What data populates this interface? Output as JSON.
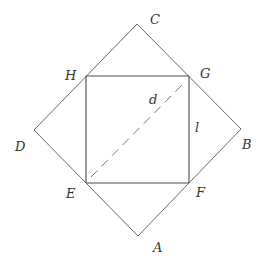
{
  "figure": {
    "width": 262,
    "height": 258,
    "colors": {
      "background": "#ffffff",
      "outer_square": "#6a6a6a",
      "inner_square": "#4a4a4a",
      "diagonal": "#7a7a7a",
      "labels": "#333333"
    },
    "outer_square": {
      "vertices": {
        "A": [
          138,
          236
        ],
        "B": [
          241,
          129
        ],
        "C": [
          137,
          24
        ],
        "D": [
          34,
          130
        ]
      }
    },
    "inner_square": {
      "vertices": {
        "E": [
          86,
          183
        ],
        "F": [
          189,
          183
        ],
        "G": [
          189,
          76
        ],
        "H": [
          86,
          76
        ]
      }
    },
    "diagonal": {
      "style": "dashed",
      "from": [
        91,
        177
      ],
      "to": [
        182,
        85
      ]
    },
    "labels": {
      "A": "A",
      "B": "B",
      "C": "C",
      "D": "D",
      "E": "E",
      "F": "F",
      "G": "G",
      "H": "H",
      "d": "d",
      "l": "l"
    }
  }
}
